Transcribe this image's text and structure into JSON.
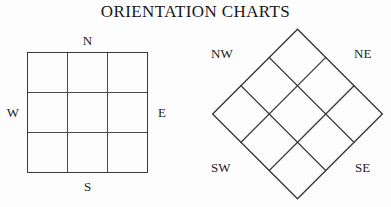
{
  "page": {
    "title": "ORIENTATION CHARTS",
    "background_color": "#fdfdfd",
    "line_color": "#3a3a3a",
    "text_color": "#1a1a1a"
  },
  "charts": [
    {
      "id": "cardinal-chart",
      "name": "cardinal-orientation-grid",
      "shape": "square",
      "rows": 3,
      "columns": 3,
      "rotation_degrees": 0,
      "labels": {
        "top": "N",
        "left": "W",
        "right": "E",
        "bottom": "S"
      }
    },
    {
      "id": "intercardinal-chart",
      "name": "intercardinal-orientation-grid",
      "shape": "diamond",
      "rows": 3,
      "columns": 3,
      "rotation_degrees": 45,
      "labels": {
        "top_left": "NW",
        "top_right": "NE",
        "bottom_left": "SW",
        "bottom_right": "SE"
      }
    }
  ]
}
